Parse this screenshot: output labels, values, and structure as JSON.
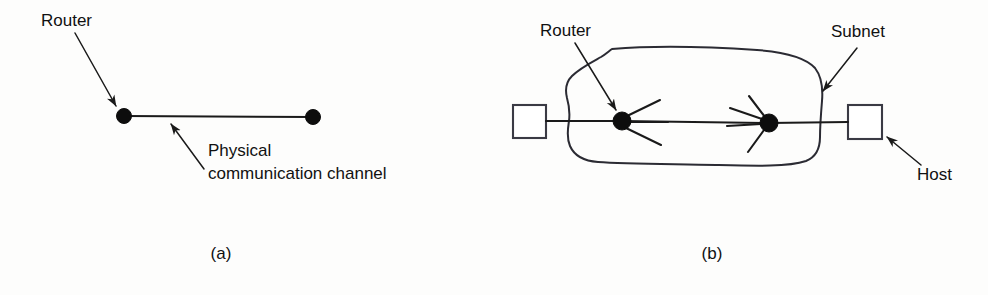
{
  "figure": {
    "background_color": "#fdfdfc",
    "ink_color": "#111111",
    "panels": [
      {
        "id": "a",
        "caption": "(a)",
        "caption_x": 221,
        "caption_y": 259,
        "labels": [
          {
            "name": "router",
            "text": "Router",
            "x": 41,
            "y": 26
          },
          {
            "name": "channel-line-1",
            "text": "Physical",
            "x": 208,
            "y": 156
          },
          {
            "name": "channel-line-2",
            "text": "communication channel",
            "x": 208,
            "y": 179
          }
        ],
        "nodes": [
          {
            "name": "router-node",
            "cx": 124,
            "cy": 116,
            "r": 7.5
          },
          {
            "name": "endpoint-node",
            "cx": 313,
            "cy": 117,
            "r": 7.5
          }
        ],
        "links": [
          {
            "name": "physical-channel",
            "x1": 124,
            "y1": 116,
            "x2": 313,
            "y2": 117
          }
        ],
        "leaders": [
          {
            "name": "router-leader",
            "x1": 75,
            "y1": 33,
            "x2": 116,
            "y2": 106
          },
          {
            "name": "channel-leader",
            "x1": 204,
            "y1": 169,
            "x2": 171,
            "y2": 124
          }
        ]
      },
      {
        "id": "b",
        "caption": "(b)",
        "caption_x": 712,
        "caption_y": 259,
        "labels": [
          {
            "name": "router",
            "text": "Router",
            "x": 540,
            "y": 36
          },
          {
            "name": "subnet",
            "text": "Subnet",
            "x": 831,
            "y": 37
          },
          {
            "name": "host",
            "text": "Host",
            "x": 917,
            "y": 180
          }
        ],
        "nodes": [
          {
            "name": "router-node-left",
            "cx": 622,
            "cy": 121,
            "r": 9
          },
          {
            "name": "router-node-right",
            "cx": 769,
            "cy": 123,
            "r": 9
          }
        ],
        "hosts": [
          {
            "name": "host-box-left",
            "x": 513,
            "y": 105,
            "width": 33,
            "height": 33
          },
          {
            "name": "host-box-right",
            "x": 848,
            "y": 105,
            "width": 34,
            "height": 34
          }
        ],
        "links": [
          {
            "name": "host-left-to-router",
            "x1": 546,
            "y1": 121,
            "x2": 622,
            "y2": 121
          },
          {
            "name": "router-to-router",
            "x1": 622,
            "y1": 121,
            "x2": 769,
            "y2": 123
          },
          {
            "name": "router-to-host-right",
            "x1": 769,
            "y1": 123,
            "x2": 848,
            "y2": 122
          }
        ],
        "spokes": [
          {
            "name": "spoke-left-router-ne",
            "x1": 625,
            "y1": 117,
            "x2": 660,
            "y2": 100
          },
          {
            "name": "spoke-left-router-e",
            "x1": 628,
            "y1": 122,
            "x2": 668,
            "y2": 122
          },
          {
            "name": "spoke-left-router-se",
            "x1": 626,
            "y1": 128,
            "x2": 661,
            "y2": 145
          },
          {
            "name": "spoke-right-router-nw",
            "x1": 765,
            "y1": 117,
            "x2": 749,
            "y2": 96
          },
          {
            "name": "spoke-right-router-nw2",
            "x1": 762,
            "y1": 119,
            "x2": 730,
            "y2": 108
          },
          {
            "name": "spoke-right-router-w",
            "x1": 761,
            "y1": 124,
            "x2": 727,
            "y2": 126
          },
          {
            "name": "spoke-right-router-sw",
            "x1": 764,
            "y1": 130,
            "x2": 748,
            "y2": 152
          }
        ],
        "leaders": [
          {
            "name": "router-leader",
            "x1": 575,
            "y1": 43,
            "x2": 616,
            "y2": 110
          },
          {
            "name": "subnet-leader",
            "x1": 857,
            "y1": 48,
            "x2": 823,
            "y2": 91
          },
          {
            "name": "host-leader",
            "x1": 921,
            "y1": 165,
            "x2": 887,
            "y2": 137
          }
        ],
        "cloud": {
          "name": "subnet-cloud",
          "description": "hand-drawn irregular closed blob enclosing both routers",
          "bounds": {
            "x": 565,
            "y": 47,
            "width": 258,
            "height": 118
          }
        }
      }
    ]
  }
}
